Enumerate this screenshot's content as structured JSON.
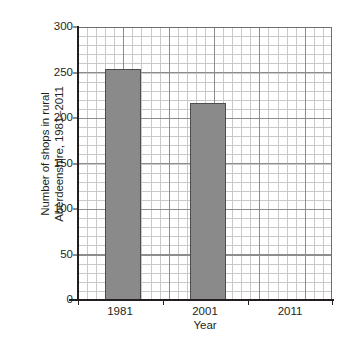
{
  "chart_data": {
    "type": "bar",
    "title": "",
    "subtitle": "",
    "xlabel": "Year",
    "ylabel": "Number of shops in rural Aberdeenshire, 1981–2011",
    "ylabel_lines": [
      "Number of shops in rural",
      "Aberdeenshire, 1981–2011"
    ],
    "categories": [
      "1981",
      "2001",
      "2011"
    ],
    "values": [
      254,
      216,
      null
    ],
    "series": [
      {
        "name": "Number of shops",
        "values": [
          254,
          216,
          null
        ]
      }
    ],
    "ylim": [
      0,
      300
    ],
    "y_ticks": [
      0,
      50,
      100,
      150,
      200,
      250,
      300
    ],
    "y_tick_labels": [
      "0",
      "50",
      "100",
      "150",
      "200",
      "250",
      "300"
    ],
    "y_major_step": 50,
    "y_minor_step": 10,
    "grid": "major-and-minor",
    "legend": "none",
    "bar_color": "#8a8a8a",
    "bar_border_color": "#4d4d4d",
    "grid_major_color": "#8d8d90",
    "grid_minor_color": "#c9c9cc",
    "axis_color": "#231f20",
    "background_color": "#ffffff"
  }
}
